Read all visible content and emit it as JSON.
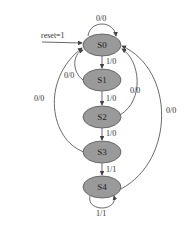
{
  "diagram": {
    "type": "state-machine",
    "reset_label": "reset=1",
    "states": [
      {
        "id": "S0",
        "label": "S0"
      },
      {
        "id": "S1",
        "label": "S1"
      },
      {
        "id": "S2",
        "label": "S2"
      },
      {
        "id": "S3",
        "label": "S3"
      },
      {
        "id": "S4",
        "label": "S4"
      }
    ],
    "transitions": [
      {
        "from": "S0",
        "to": "S0",
        "label": "0/0"
      },
      {
        "from": "S0",
        "to": "S1",
        "label": "1/0"
      },
      {
        "from": "S1",
        "to": "S0",
        "label": "0/0"
      },
      {
        "from": "S1",
        "to": "S2",
        "label": "1/0"
      },
      {
        "from": "S2",
        "to": "S0",
        "label": "0/0"
      },
      {
        "from": "S2",
        "to": "S3",
        "label": "1/0"
      },
      {
        "from": "S3",
        "to": "S0",
        "label": "0/0"
      },
      {
        "from": "S3",
        "to": "S4",
        "label": "1/1"
      },
      {
        "from": "S4",
        "to": "S0",
        "label": "0/0"
      },
      {
        "from": "S4",
        "to": "S4",
        "label": "1/1"
      }
    ]
  }
}
